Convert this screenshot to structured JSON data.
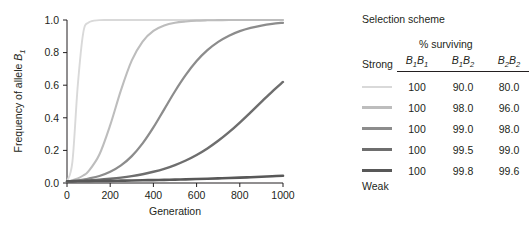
{
  "chart_data": {
    "type": "line",
    "title": "",
    "xlabel": "Generation",
    "ylabel": "Frequency of allele B1",
    "ylabel_base": "Frequency of allele ",
    "ylabel_italic": "B",
    "ylabel_sub": "1",
    "xlim": [
      0,
      1000
    ],
    "ylim": [
      0.0,
      1.0
    ],
    "xticks": [
      0,
      200,
      400,
      600,
      800,
      1000
    ],
    "xtick_labels": [
      "0",
      "200",
      "400",
      "600",
      "800",
      "1000"
    ],
    "yticks": [
      0.0,
      0.2,
      0.4,
      0.6,
      0.8,
      1.0
    ],
    "ytick_labels": [
      "0.0",
      "0.2",
      "0.4",
      "0.6",
      "0.8",
      "1.0"
    ],
    "grid": false,
    "legend_position": "right",
    "x": [
      0,
      25,
      50,
      75,
      100,
      150,
      200,
      250,
      300,
      350,
      400,
      450,
      500,
      550,
      600,
      650,
      700,
      750,
      800,
      850,
      900,
      950,
      1000
    ],
    "series": [
      {
        "name": "100 / 90.0 / 80.0",
        "color": "#d9d9d9",
        "values": [
          0.01,
          0.13,
          0.6,
          0.92,
          0.985,
          0.999,
          1.0,
          1.0,
          1.0,
          1.0,
          1.0,
          1.0,
          1.0,
          1.0,
          1.0,
          1.0,
          1.0,
          1.0,
          1.0,
          1.0,
          1.0,
          1.0,
          1.0
        ]
      },
      {
        "name": "100 / 98.0 / 96.0",
        "color": "#bdbdbd",
        "values": [
          0.01,
          0.017,
          0.028,
          0.046,
          0.073,
          0.175,
          0.355,
          0.57,
          0.752,
          0.868,
          0.933,
          0.966,
          0.983,
          0.991,
          0.996,
          0.998,
          0.999,
          1.0,
          1.0,
          1.0,
          1.0,
          1.0,
          1.0
        ]
      },
      {
        "name": "100 / 99.0 / 98.0",
        "color": "#8c8c8c",
        "values": [
          0.01,
          0.013,
          0.016,
          0.021,
          0.027,
          0.043,
          0.069,
          0.108,
          0.165,
          0.243,
          0.341,
          0.452,
          0.563,
          0.663,
          0.748,
          0.815,
          0.866,
          0.904,
          0.932,
          0.952,
          0.966,
          0.976,
          0.983
        ]
      },
      {
        "name": "100 / 99.5 / 99.0",
        "color": "#6e6e6e",
        "values": [
          0.01,
          0.011,
          0.013,
          0.014,
          0.016,
          0.02,
          0.026,
          0.033,
          0.042,
          0.054,
          0.069,
          0.087,
          0.11,
          0.138,
          0.172,
          0.212,
          0.259,
          0.312,
          0.371,
          0.434,
          0.498,
          0.561,
          0.62
        ]
      },
      {
        "name": "100 / 99.8 / 99.6",
        "color": "#585858",
        "values": [
          0.01,
          0.0103,
          0.0107,
          0.0111,
          0.0115,
          0.0124,
          0.0133,
          0.0144,
          0.0155,
          0.0167,
          0.018,
          0.0194,
          0.021,
          0.0226,
          0.0244,
          0.0263,
          0.0284,
          0.0306,
          0.033,
          0.0356,
          0.0384,
          0.0414,
          0.0446
        ]
      }
    ]
  },
  "legend": {
    "title": "Selection scheme",
    "surviving_header": "% surviving",
    "strong_label": "Strong",
    "weak_label": "Weak",
    "genotypes": [
      {
        "allele": "B",
        "sub1": "1",
        "allele2": "B",
        "sub2": "1",
        "text": "B1B1"
      },
      {
        "allele": "B",
        "sub1": "1",
        "allele2": "B",
        "sub2": "2",
        "text": "B1B2"
      },
      {
        "allele": "B",
        "sub1": "2",
        "allele2": "B",
        "sub2": "2",
        "text": "B2B2"
      }
    ],
    "rows": [
      {
        "color": "#d9d9d9",
        "thickness": 2.0,
        "values": [
          "100",
          "90.0",
          "80.0"
        ]
      },
      {
        "color": "#bdbdbd",
        "thickness": 2.2,
        "values": [
          "100",
          "98.0",
          "96.0"
        ]
      },
      {
        "color": "#8c8c8c",
        "thickness": 2.4,
        "values": [
          "100",
          "99.0",
          "98.0"
        ]
      },
      {
        "color": "#6e6e6e",
        "thickness": 2.6,
        "values": [
          "100",
          "99.5",
          "99.0"
        ]
      },
      {
        "color": "#585858",
        "thickness": 2.8,
        "values": [
          "100",
          "99.8",
          "99.6"
        ]
      }
    ]
  },
  "colors": {
    "axis": "#231f20",
    "text": "#231f20",
    "background": "#ffffff"
  }
}
